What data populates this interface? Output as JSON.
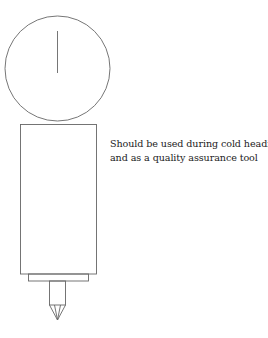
{
  "diagram": {
    "type": "tool-illustration",
    "components": [
      {
        "name": "dial-gauge",
        "shape": "circle"
      },
      {
        "name": "needle",
        "shape": "line"
      },
      {
        "name": "body",
        "shape": "rectangle"
      },
      {
        "name": "base",
        "shape": "rectangle"
      },
      {
        "name": "stem",
        "shape": "rectangle"
      },
      {
        "name": "probe-tip",
        "shape": "triangle"
      }
    ],
    "stroke_color": "#666666"
  },
  "caption": {
    "line1": "Should be used during cold heading",
    "line2": "and as a quality assurance tool"
  }
}
